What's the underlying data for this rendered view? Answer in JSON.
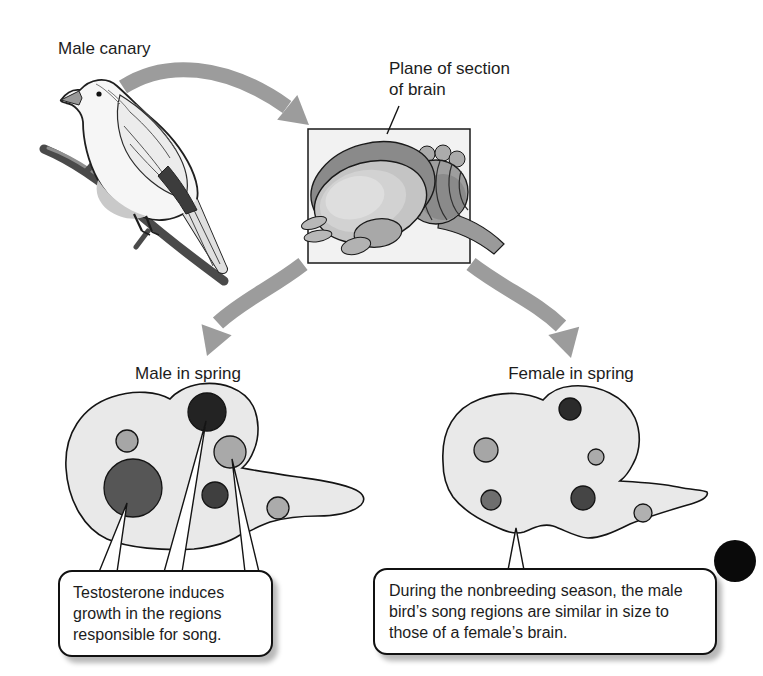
{
  "labels": {
    "male_canary": "Male canary",
    "plane_of_section": "Plane of section\nof brain",
    "male_in_spring": "Male in spring",
    "female_in_spring": "Female in spring"
  },
  "callouts": {
    "male": "Testosterone induces growth in the regions responsible for song.",
    "female": "During the nonbreeding season, the male bird’s song regions are similar in size to those of a female’s brain."
  },
  "brain_sections": {
    "male": {
      "regions": [
        {
          "name": "small-upper-left",
          "x": 127,
          "y": 441,
          "r": 11,
          "color": "#a6a6a6"
        },
        {
          "name": "large-left",
          "x": 133,
          "y": 488,
          "r": 29,
          "color": "#565656"
        },
        {
          "name": "dark-top",
          "x": 207,
          "y": 412,
          "r": 19,
          "color": "#232323"
        },
        {
          "name": "mid-right",
          "x": 230,
          "y": 452,
          "r": 16,
          "color": "#a9a9a9"
        },
        {
          "name": "lower-mid",
          "x": 215,
          "y": 495,
          "r": 13,
          "color": "#3f3f3f"
        },
        {
          "name": "tail-right",
          "x": 278,
          "y": 508,
          "r": 11,
          "color": "#ababab"
        }
      ]
    },
    "female": {
      "regions": [
        {
          "name": "dark-top",
          "x": 570,
          "y": 409,
          "r": 11,
          "color": "#2b2b2b"
        },
        {
          "name": "left",
          "x": 486,
          "y": 450,
          "r": 12,
          "color": "#a6a6a6"
        },
        {
          "name": "small-mid",
          "x": 596,
          "y": 457,
          "r": 8,
          "color": "#ababab"
        },
        {
          "name": "lower-left",
          "x": 491,
          "y": 500,
          "r": 10,
          "color": "#6e6e6e"
        },
        {
          "name": "lower-mid",
          "x": 583,
          "y": 498,
          "r": 12,
          "color": "#454545"
        },
        {
          "name": "tail-right",
          "x": 643,
          "y": 513,
          "r": 9,
          "color": "#b0b0b0"
        }
      ]
    }
  },
  "colors": {
    "arrow": "#9c9c9c",
    "outline": "#141414",
    "section_fill": "#e9e9e9",
    "page_dot": "#0a0a0a"
  }
}
